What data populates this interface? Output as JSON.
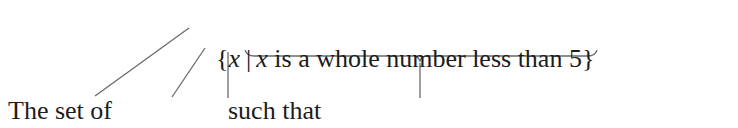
{
  "notation": {
    "open_brace": "{",
    "variable": "x",
    "bar": "|",
    "condition_var": "x",
    "condition_rest": " is a whole number less than 5",
    "close_brace": "}"
  },
  "annotations": [
    {
      "label": "The set of",
      "points_to": "{"
    },
    {
      "label_text": "all ",
      "label_var": "x",
      "points_to": "x"
    },
    {
      "label": "such that",
      "points_to": "|"
    },
    {
      "label_var": "x",
      "label_text": " is a whole number less than 5",
      "points_to": "condition (underbrace)"
    }
  ],
  "colors": {
    "text": "#1c1c1c",
    "lines": "#6a6a6a",
    "background": "#ffffff"
  }
}
